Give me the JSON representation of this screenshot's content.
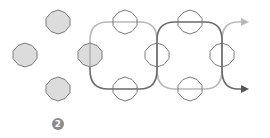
{
  "diagram": {
    "colors": {
      "background": "#ffffff",
      "filled_node_fill": "#dcdcdc",
      "node_stroke": "#7a7a7a",
      "open_node_fill": "#ffffff",
      "light_strand": "#b8b8b8",
      "dark_strand": "#6a6a6a",
      "badge_fill": "#8a8a8a"
    },
    "standalone_nodes": [
      {
        "x": 58,
        "y": 22
      },
      {
        "x": 25,
        "y": 55
      },
      {
        "x": 58,
        "y": 89
      }
    ],
    "start_node": {
      "x": 90,
      "y": 55
    },
    "open_nodes": [
      {
        "x": 125,
        "y": 22
      },
      {
        "x": 125,
        "y": 89
      },
      {
        "x": 157,
        "y": 55
      },
      {
        "x": 190,
        "y": 22
      },
      {
        "x": 190,
        "y": 89
      },
      {
        "x": 222,
        "y": 55
      }
    ],
    "badge": {
      "label": "2",
      "x": 58,
      "y": 124
    }
  }
}
